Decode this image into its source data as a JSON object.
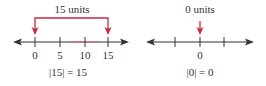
{
  "colors": {
    "axis": "#333333",
    "highlight": "#d0304a",
    "text": "#333333"
  },
  "left_diagram": {
    "distance_label": "15 units",
    "ticks": [
      {
        "value": 0,
        "label": "0",
        "x": 35
      },
      {
        "value": 5,
        "label": "5",
        "x": 60
      },
      {
        "value": 10,
        "label": "10",
        "x": 85
      },
      {
        "value": 15,
        "label": "15",
        "x": 108
      }
    ],
    "equation": "|15| = 15"
  },
  "right_diagram": {
    "distance_label": "0 units",
    "ticks": [
      {
        "label": "",
        "x": 175
      },
      {
        "label": "0",
        "x": 200
      },
      {
        "label": "",
        "x": 224
      }
    ],
    "equation": "|0| = 0"
  }
}
